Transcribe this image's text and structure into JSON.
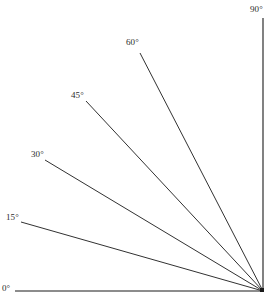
{
  "figure": {
    "name": "angle-ray-diagram",
    "background_color": "#ffffff",
    "line_color": "#1a1a1a",
    "text_color": "#2b2b2b",
    "width": 271,
    "height": 304
  },
  "vertex": {
    "x": 263,
    "y": 291
  },
  "rays": [
    {
      "id": "ray-0",
      "label": "0°",
      "angle_deg": 0,
      "start": {
        "x": 15,
        "y": 291
      },
      "end": {
        "x": 263,
        "y": 291
      },
      "label_pos": {
        "x": 2,
        "y": 284
      }
    },
    {
      "id": "ray-15",
      "label": "15°",
      "angle_deg": 15,
      "start": {
        "x": 21,
        "y": 222
      },
      "end": {
        "x": 263,
        "y": 291
      },
      "label_pos": {
        "x": 6,
        "y": 213
      }
    },
    {
      "id": "ray-30",
      "label": "30°",
      "angle_deg": 30,
      "start": {
        "x": 45,
        "y": 160
      },
      "end": {
        "x": 263,
        "y": 291
      },
      "label_pos": {
        "x": 31,
        "y": 150
      }
    },
    {
      "id": "ray-45",
      "label": "45°",
      "angle_deg": 45,
      "start": {
        "x": 86,
        "y": 101
      },
      "end": {
        "x": 263,
        "y": 291
      },
      "label_pos": {
        "x": 71,
        "y": 91
      }
    },
    {
      "id": "ray-60",
      "label": "60°",
      "angle_deg": 60,
      "start": {
        "x": 140,
        "y": 53
      },
      "end": {
        "x": 263,
        "y": 291
      },
      "label_pos": {
        "x": 126,
        "y": 38
      }
    },
    {
      "id": "ray-90",
      "label": "90°",
      "angle_deg": 90,
      "start": {
        "x": 263,
        "y": 18
      },
      "end": {
        "x": 263,
        "y": 291
      },
      "label_pos": {
        "x": 250,
        "y": 5
      }
    }
  ],
  "chart_data": {
    "type": "line",
    "title": "",
    "xlabel": "",
    "ylabel": "",
    "categories": [
      "0°",
      "15°",
      "30°",
      "45°",
      "60°",
      "90°"
    ],
    "values": [
      0,
      15,
      30,
      45,
      60,
      90
    ],
    "legend_position": "none",
    "grid": false
  }
}
